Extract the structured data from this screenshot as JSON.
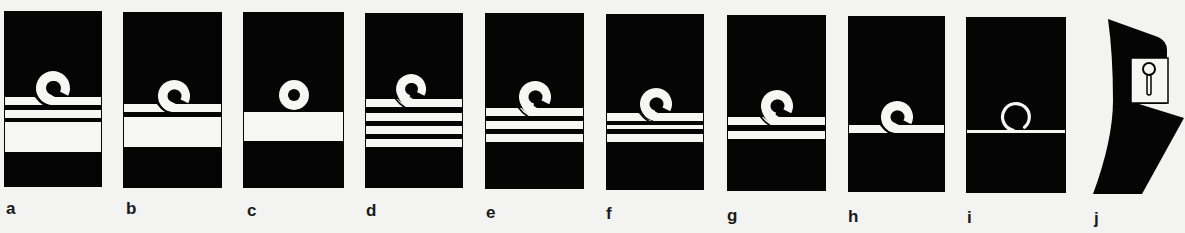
{
  "figure": {
    "colors": {
      "background": "#f3f3f1",
      "board": "#050505",
      "lace": "#f6f6f4"
    },
    "panels": [
      {
        "label": "a",
        "box": [
          4,
          11,
          98,
          176
        ],
        "loop": {
          "cx": 53,
          "cy": 88,
          "r": 17,
          "hole": 7,
          "type": "curl"
        },
        "stripes": [
          [
            97,
            8
          ],
          [
            110,
            8
          ],
          [
            122,
            30
          ]
        ]
      },
      {
        "label": "b",
        "box": [
          123,
          12,
          99,
          176
        ],
        "loop": {
          "cx": 174,
          "cy": 96,
          "r": 16,
          "hole": 6.5,
          "type": "curl"
        },
        "stripes": [
          [
            104,
            8
          ],
          [
            117,
            30
          ]
        ]
      },
      {
        "label": "c",
        "box": [
          243,
          12,
          101,
          176
        ],
        "loop": {
          "cx": 294,
          "cy": 95,
          "r": 15,
          "hole": 6,
          "type": "ring"
        },
        "stripes": [
          [
            112,
            29
          ]
        ]
      },
      {
        "label": "d",
        "box": [
          365,
          13,
          98,
          175
        ],
        "loop": {
          "cx": 411,
          "cy": 89,
          "r": 15,
          "hole": 6,
          "type": "curl"
        },
        "stripes": [
          [
            99,
            8
          ],
          [
            113,
            8
          ],
          [
            126,
            8
          ],
          [
            139,
            8
          ]
        ]
      },
      {
        "label": "e",
        "box": [
          485,
          13,
          99,
          176
        ],
        "loop": {
          "cx": 535,
          "cy": 97,
          "r": 16,
          "hole": 6.5,
          "type": "curl"
        },
        "stripes": [
          [
            108,
            8
          ],
          [
            121,
            8
          ],
          [
            134,
            8
          ]
        ]
      },
      {
        "label": "f",
        "box": [
          606,
          14,
          98,
          176
        ],
        "loop": {
          "cx": 656,
          "cy": 104,
          "r": 16,
          "hole": 6.5,
          "type": "curl"
        },
        "stripes": [
          [
            113,
            8
          ],
          [
            125,
            4
          ],
          [
            134,
            8
          ]
        ]
      },
      {
        "label": "g",
        "box": [
          727,
          15,
          99,
          176
        ],
        "loop": {
          "cx": 777,
          "cy": 106,
          "r": 16,
          "hole": 6.5,
          "type": "curl"
        },
        "stripes": [
          [
            117,
            8
          ],
          [
            131,
            8
          ]
        ]
      },
      {
        "label": "h",
        "box": [
          848,
          16,
          97,
          176
        ],
        "loop": {
          "cx": 897,
          "cy": 117,
          "r": 16,
          "hole": 6.5,
          "type": "curl"
        },
        "stripes": [
          [
            125,
            8
          ]
        ]
      },
      {
        "label": "i",
        "box": [
          966,
          17,
          100,
          176
        ],
        "loop": {
          "cx": 1016,
          "cy": 117,
          "r": 15,
          "hole": 12,
          "type": "thin"
        },
        "stripes": [
          [
            130,
            3
          ]
        ]
      },
      {
        "label": "j",
        "type": "collar-tab"
      }
    ],
    "labels": [
      {
        "text": "a",
        "x": 6,
        "y": 200
      },
      {
        "text": "b",
        "x": 126,
        "y": 200
      },
      {
        "text": "c",
        "x": 247,
        "y": 202
      },
      {
        "text": "d",
        "x": 366,
        "y": 202
      },
      {
        "text": "e",
        "x": 486,
        "y": 204
      },
      {
        "text": "f",
        "x": 606,
        "y": 205
      },
      {
        "text": "g",
        "x": 727,
        "y": 207
      },
      {
        "text": "h",
        "x": 848,
        "y": 208
      },
      {
        "text": "i",
        "x": 967,
        "y": 209
      },
      {
        "text": "j",
        "x": 1094,
        "y": 210
      }
    ]
  }
}
